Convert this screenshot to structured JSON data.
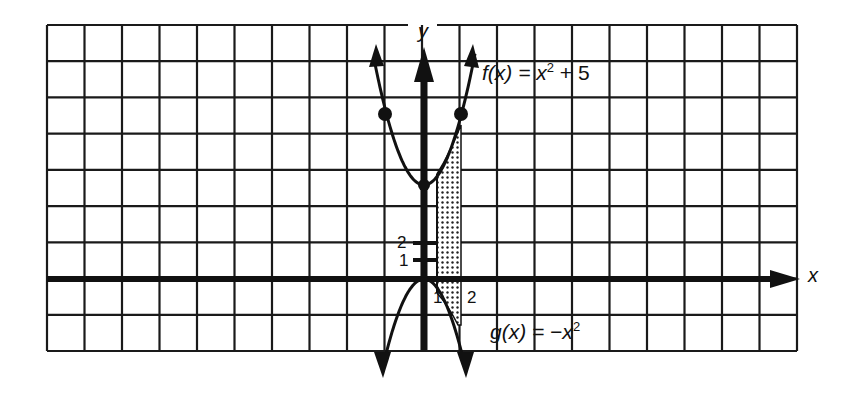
{
  "chart_data": {
    "type": "line",
    "title": "",
    "xlabel": "x",
    "ylabel": "y",
    "grid": true,
    "x_ticks_labeled": [
      "1",
      "2"
    ],
    "y_ticks_labeled": [
      "1",
      "2"
    ],
    "series": [
      {
        "name": "f(x) = x² + 5",
        "function": "x^2 + 5",
        "vertex": [
          0,
          5
        ],
        "marked_points": [
          [
            -1,
            6
          ],
          [
            1,
            6
          ]
        ]
      },
      {
        "name": "g(x) = −x²",
        "function": "-x^2",
        "vertex": [
          0,
          0
        ]
      }
    ],
    "shaded_region": {
      "between": [
        "f(x)",
        "g(x)"
      ],
      "x_from": 1,
      "x_to": 2
    },
    "annotations": [
      "f(x) = x² + 5",
      "g(x) = −x²"
    ]
  },
  "labels": {
    "x_axis": "x",
    "y_axis": "y",
    "f_name": "f(x)",
    "f_eq": " = x",
    "f_exp": "2",
    "f_tail": " + 5",
    "g_name": "g(x)",
    "g_eq": " =  −x",
    "g_exp": "2",
    "ytick1": "1",
    "ytick2": "2",
    "xtick1": "1",
    "xtick2": "2"
  },
  "colors": {
    "ink": "#111111",
    "paper": "#ffffff"
  }
}
